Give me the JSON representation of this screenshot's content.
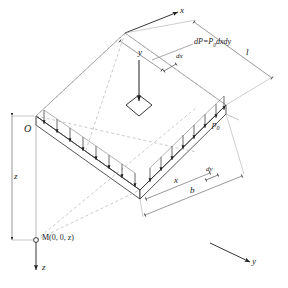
{
  "figure": {
    "axes": {
      "x_label": "x",
      "y_label": "y",
      "z_label": "z"
    },
    "origin_label": "O",
    "point_label": "M(0, 0, z)",
    "load_intensity_label": "p",
    "load_intensity_sub": "0",
    "formula": {
      "lhs": "d",
      "lhs_italic": "P",
      "eq": "=",
      "rhs_p": "P",
      "rhs_sub": "0",
      "rhs_rest": "dxdy",
      "full": "dP=P0dxdy"
    },
    "dimensions": [
      {
        "name": "length-l",
        "label": "l"
      },
      {
        "name": "width-b",
        "label": "b"
      },
      {
        "name": "offset-x",
        "label": "x"
      },
      {
        "name": "offset-y",
        "label": "y"
      },
      {
        "name": "depth-z",
        "label": "z"
      },
      {
        "name": "element-dx",
        "label": "dx"
      },
      {
        "name": "element-dy",
        "label": "dy"
      }
    ],
    "colors": {
      "line": "#2b2b2b",
      "thin": "#6e6e6e",
      "dashed": "#9a9a9a",
      "background": "#ffffff"
    }
  }
}
